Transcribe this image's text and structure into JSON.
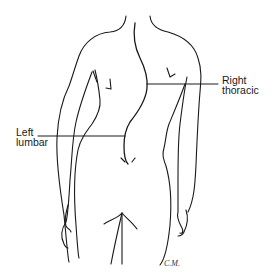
{
  "diagram": {
    "labels": {
      "right_thoracic": {
        "line1": "Right",
        "line2": "thoracic"
      },
      "left_lumbar": {
        "line1": "Left",
        "line2": "lumbar"
      }
    },
    "signature": "C.M.",
    "colors": {
      "line": "#1a1a1a",
      "background": "#ffffff"
    }
  }
}
